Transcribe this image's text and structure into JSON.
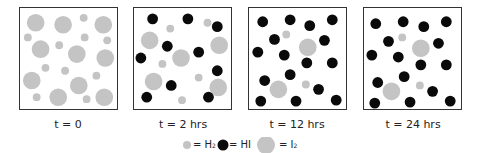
{
  "colors": {
    "h2": "#c4c4c4",
    "hi": "#0a0a0a",
    "i2": "#c4c4c4",
    "border": "#333333"
  },
  "panels": [
    {
      "caption": "t = 0",
      "left": 19,
      "h2": [
        [
          65,
          10
        ],
        [
          8,
          30
        ],
        [
          66,
          30
        ],
        [
          89,
          33
        ],
        [
          40,
          38
        ],
        [
          26,
          61
        ],
        [
          46,
          64
        ],
        [
          78,
          69
        ],
        [
          17,
          91
        ],
        [
          68,
          93
        ]
      ],
      "hi": [],
      "i2": [
        [
          16,
          15
        ],
        [
          44,
          17
        ],
        [
          85,
          17
        ],
        [
          21,
          42
        ],
        [
          58,
          47
        ],
        [
          87,
          51
        ],
        [
          12,
          74
        ],
        [
          60,
          79
        ],
        [
          39,
          91
        ],
        [
          86,
          91
        ]
      ]
    },
    {
      "caption": "t = 2 hrs",
      "left": 133,
      "h2": [
        [
          75,
          15
        ],
        [
          37,
          21
        ],
        [
          29,
          57
        ],
        [
          66,
          71
        ],
        [
          49,
          94
        ]
      ],
      "hi": [
        [
          19,
          11
        ],
        [
          55,
          11
        ],
        [
          85,
          19
        ],
        [
          34,
          39
        ],
        [
          66,
          45
        ],
        [
          7,
          51
        ],
        [
          85,
          64
        ],
        [
          38,
          79
        ],
        [
          13,
          91
        ],
        [
          76,
          91
        ]
      ],
      "i2": [
        [
          16,
          33
        ],
        [
          87,
          38
        ],
        [
          48,
          51
        ],
        [
          20,
          75
        ],
        [
          86,
          81
        ]
      ]
    },
    {
      "caption": "t = 12 hrs",
      "left": 248,
      "h2": [
        [
          38,
          27
        ],
        [
          58,
          78
        ]
      ],
      "hi": [
        [
          14,
          14
        ],
        [
          42,
          12
        ],
        [
          62,
          18
        ],
        [
          85,
          12
        ],
        [
          26,
          32
        ],
        [
          77,
          33
        ],
        [
          9,
          45
        ],
        [
          36,
          48
        ],
        [
          59,
          56
        ],
        [
          85,
          56
        ],
        [
          42,
          68
        ],
        [
          16,
          74
        ],
        [
          71,
          83
        ],
        [
          12,
          95
        ],
        [
          48,
          95
        ],
        [
          89,
          94
        ]
      ],
      "i2": [
        [
          60,
          40
        ],
        [
          30,
          83
        ]
      ]
    },
    {
      "caption": "t = 24 hrs",
      "left": 363,
      "h2": [
        [
          39,
          30
        ],
        [
          57,
          79
        ]
      ],
      "hi": [
        [
          12,
          16
        ],
        [
          40,
          14
        ],
        [
          61,
          19
        ],
        [
          84,
          14
        ],
        [
          25,
          34
        ],
        [
          76,
          36
        ],
        [
          8,
          48
        ],
        [
          35,
          50
        ],
        [
          58,
          58
        ],
        [
          84,
          58
        ],
        [
          41,
          70
        ],
        [
          14,
          76
        ],
        [
          70,
          85
        ],
        [
          11,
          97
        ],
        [
          47,
          96
        ],
        [
          88,
          95
        ]
      ],
      "i2": [
        [
          58,
          41
        ],
        [
          28,
          85
        ]
      ]
    }
  ],
  "legend": {
    "h2_label": "= H",
    "h2_sub": "2",
    "hi_label": "= HI",
    "i2_label": "= I",
    "i2_sub": "2"
  },
  "chart_data": {
    "type": "diagram",
    "title": "",
    "categories": [
      "t = 0",
      "t = 2 hrs",
      "t = 12 hrs",
      "t = 24 hrs"
    ],
    "series": [
      {
        "name": "H2",
        "values": [
          10,
          5,
          2,
          2
        ]
      },
      {
        "name": "HI",
        "values": [
          0,
          10,
          16,
          16
        ]
      },
      {
        "name": "I2",
        "values": [
          10,
          5,
          2,
          2
        ]
      }
    ],
    "legend": [
      "= H2",
      "= HI",
      "= I2"
    ]
  }
}
